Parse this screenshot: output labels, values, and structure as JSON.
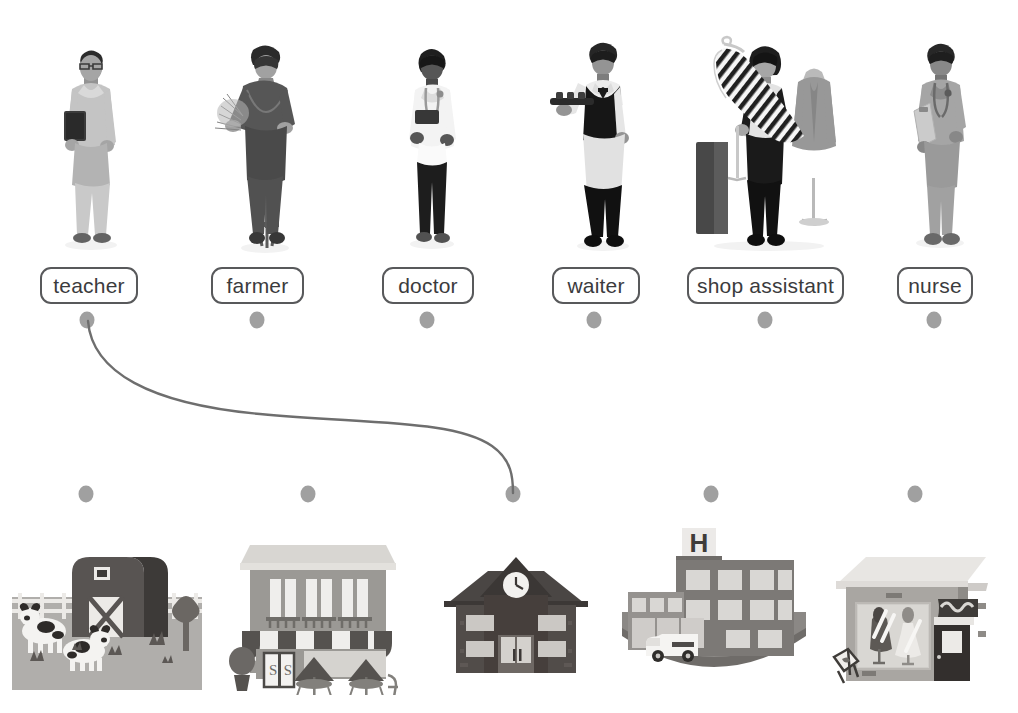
{
  "exercise": {
    "type": "matching-worksheet",
    "title": "Match the jobs to the places",
    "line_color": "#6e6e6e",
    "dot_color": "#a0a0a0",
    "chip_border_color": "#58595b",
    "chip_text_color": "#3b3b3d"
  },
  "jobs_row": {
    "items": [
      {
        "id": "teacher",
        "label": "teacher",
        "photo": "woman-holding-book",
        "dot_x": 87,
        "chip_left": 40,
        "chip_width": 98
      },
      {
        "id": "farmer",
        "label": "farmer",
        "photo": "man-with-pitchfork-and-hay",
        "dot_x": 257,
        "chip_left": 211,
        "chip_width": 93
      },
      {
        "id": "doctor",
        "label": "doctor",
        "photo": "woman-in-white-coat",
        "dot_x": 427,
        "chip_left": 382,
        "chip_width": 92
      },
      {
        "id": "waiter",
        "label": "waiter",
        "photo": "man-with-serving-tray",
        "dot_x": 594,
        "chip_left": 552,
        "chip_width": 88
      },
      {
        "id": "shop-assistant",
        "label": "shop assistant",
        "photo": "woman-holding-dress-on-hanger",
        "dot_x": 765,
        "chip_left": 687,
        "chip_width": 157
      },
      {
        "id": "nurse",
        "label": "nurse",
        "photo": "man-in-scrubs-with-clipboard",
        "dot_x": 934,
        "chip_left": 897,
        "chip_width": 76
      }
    ],
    "chip_top": 267,
    "dot_y": 320
  },
  "places_row": {
    "items": [
      {
        "id": "farm",
        "label": "farm",
        "art": "barn-with-cows",
        "dot_x": 86
      },
      {
        "id": "shop-cafe",
        "label": "shop",
        "art": "shop-with-striped-awning",
        "dot_x": 308
      },
      {
        "id": "school",
        "label": "school",
        "art": "school-with-clock-tower",
        "dot_x": 513
      },
      {
        "id": "hospital",
        "label": "hospital",
        "art": "hospital-with-ambulance",
        "dot_x": 711
      },
      {
        "id": "clothes-shop",
        "label": "clothes shop",
        "art": "clothing-store-window",
        "dot_x": 915
      }
    ],
    "dot_y": 494
  },
  "connections": [
    {
      "from": "teacher",
      "to": "school",
      "from_x": 87,
      "from_y": 320,
      "to_x": 513,
      "to_y": 494
    }
  ],
  "art_text": {
    "hospital_sign": "H",
    "shop_door_glyph": "S"
  }
}
